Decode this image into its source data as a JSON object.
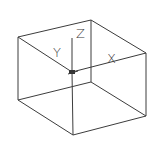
{
  "diagram": {
    "type": "wireframe-box-with-axes",
    "background": "#ffffff",
    "line_color": "#3c3c3c",
    "vertices": {
      "top_left": [
        18,
        37
      ],
      "top_back": [
        91,
        20
      ],
      "top_right": [
        146,
        53
      ],
      "top_front": [
        72,
        72
      ],
      "bottom_left": [
        18,
        100
      ],
      "bottom_back": [
        91,
        82
      ],
      "bottom_right": [
        146,
        116
      ],
      "bottom_front": [
        73,
        135
      ]
    },
    "axes": {
      "origin": [
        72,
        72
      ],
      "x": {
        "label": "X",
        "end": [
          146,
          53
        ],
        "label_pos": [
          107,
          63
        ]
      },
      "y": {
        "label": "Y",
        "label_pos": [
          53,
          57
        ]
      },
      "z": {
        "label": "Z",
        "end": [
          72,
          38
        ],
        "label_pos": [
          76,
          38
        ]
      }
    }
  }
}
